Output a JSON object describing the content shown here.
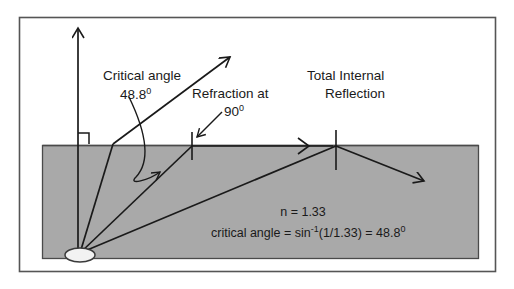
{
  "figure": {
    "colors": {
      "frame_border": "#555555",
      "water_fill": "#a9a9a9",
      "water_border": "#4a4a4a",
      "ray_stroke": "#1a1a1a",
      "text": "#1a1a1a",
      "source_fill": "#f2f2f2",
      "background": "#ffffff"
    }
  },
  "labels": {
    "critical_angle": {
      "line1": "Critical angle",
      "line2_value": "48.8",
      "line2_superscript": "0"
    },
    "refraction": {
      "line1": "Refraction at",
      "line2_value": "90",
      "line2_superscript": "0"
    },
    "total_internal_reflection": {
      "line1": "Total Internal",
      "line2": "Reflection"
    }
  },
  "equations": {
    "refractive_index": "n = 1.33",
    "critical_angle_formula": {
      "prefix": "critical angle = sin",
      "exponent": "-1",
      "body": "(1/1.33) = 48.8",
      "superscript": "0"
    }
  },
  "physics_values": {
    "n": "1.33",
    "critical_angle_degrees": "48.8",
    "refraction_angle_degrees": "90"
  }
}
